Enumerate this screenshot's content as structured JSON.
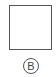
{
  "option": {
    "label": "B",
    "figure": "empty-square"
  },
  "colors": {
    "stroke": "#555555",
    "text": "#444444",
    "background": "#ffffff"
  }
}
